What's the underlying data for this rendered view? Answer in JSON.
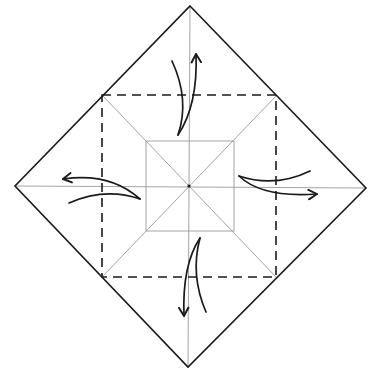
{
  "diagram": {
    "type": "origami-fold-diagram",
    "colors": {
      "background": "#ffffff",
      "outline": "#1a1a1a",
      "crease": "#9a9a9a",
      "dashed": "#1a1a1a",
      "arrow": "#1a1a1a"
    },
    "outer_diamond": {
      "top": [
        190,
        6
      ],
      "right": [
        366,
        188
      ],
      "bottom": [
        188,
        367
      ],
      "left": [
        15,
        186
      ]
    },
    "dashed_square": {
      "top_left": [
        102,
        95
      ],
      "top_right": [
        276,
        96
      ],
      "bottom_right": [
        276,
        277
      ],
      "bottom_left": [
        102,
        277
      ]
    },
    "inner_square": {
      "top_left": [
        146,
        141
      ],
      "top_right": [
        234,
        141
      ],
      "bottom_right": [
        234,
        231
      ],
      "bottom_left": [
        146,
        231
      ]
    },
    "center": [
      189,
      186
    ],
    "arrows": [
      {
        "name": "top",
        "direction": "up"
      },
      {
        "name": "left",
        "direction": "left"
      },
      {
        "name": "right",
        "direction": "right"
      },
      {
        "name": "bottom",
        "direction": "down"
      }
    ]
  }
}
